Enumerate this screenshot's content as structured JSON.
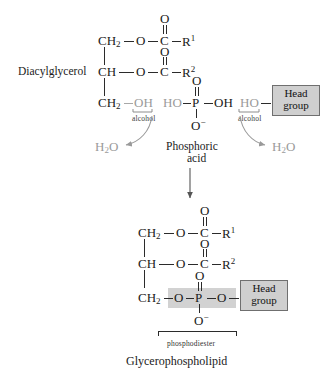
{
  "figure": {
    "background_color": "#ffffff",
    "ink_color": "#1a1a1a",
    "gray_color": "#9a9a9a",
    "highlight_color": "#d2d2d2",
    "headbox_fill": "#cfcfcf",
    "headbox_border": "#6f6f6f"
  },
  "labels": {
    "diacylglycerol": "Diacylglycerol",
    "phosphoric_acid_line1": "Phosphoric",
    "phosphoric_acid_line2": "acid",
    "alcohol_left": "alcohol",
    "alcohol_right": "alcohol",
    "water_left": "H",
    "water_left_sub": "2",
    "water_left_tail": "O",
    "water_right": "H",
    "water_right_sub": "2",
    "water_right_tail": "O",
    "phosphodiester": "phosphodiester",
    "product": "Glycerophospholipid",
    "head_group_line1": "Head",
    "head_group_line2": "group"
  },
  "reactant_top": {
    "name": "Diacylglycerol",
    "rows": [
      {
        "id": "row1",
        "left": "CH",
        "left_sub": "2",
        "linker": "O",
        "carbonyl": "C",
        "carbonyl_o": "O",
        "chain": "R",
        "chain_sup": "1"
      },
      {
        "id": "row2",
        "left": "CH",
        "left_sub": "",
        "linker": "O",
        "carbonyl": "C",
        "carbonyl_o": "O",
        "chain": "R",
        "chain_sup": "2"
      },
      {
        "id": "row3",
        "left": "CH",
        "left_sub": "2",
        "hydroxyl": "OH"
      }
    ]
  },
  "reactant_phosphate": {
    "name": "Phosphoric acid",
    "center": "P",
    "top_oxygen": "O",
    "bottom_oxygen": "O",
    "bottom_oxygen_charge": "−",
    "left_hydroxyl": "HO",
    "right_hydroxyl": "OH"
  },
  "reactant_head": {
    "hydroxyl": "HO",
    "chip_line1": "Head",
    "chip_line2": "group"
  },
  "product": {
    "name": "Glycerophospholipid",
    "bracket_label": "phosphodiester",
    "rows": [
      {
        "id": "prow1",
        "left": "CH",
        "left_sub": "2",
        "linker": "O",
        "carbonyl": "C",
        "carbonyl_o": "O",
        "chain": "R",
        "chain_sup": "1"
      },
      {
        "id": "prow2",
        "left": "CH",
        "left_sub": "",
        "linker": "O",
        "carbonyl": "C",
        "carbonyl_o": "O",
        "chain": "R",
        "chain_sup": "2"
      },
      {
        "id": "prow3",
        "left": "CH",
        "left_sub": "2",
        "linker_left": "O",
        "center": "P",
        "linker_right": "O",
        "top_oxygen": "O",
        "bottom_oxygen": "O",
        "bottom_oxygen_charge": "−"
      }
    ],
    "chip_line1": "Head",
    "chip_line2": "group"
  },
  "byproducts": [
    {
      "id": "water-left",
      "formula": "H2O",
      "arrow": "curved-left"
    },
    {
      "id": "water-right",
      "formula": "H2O",
      "arrow": "curved-right"
    }
  ],
  "reaction_arrow": {
    "direction": "down",
    "style": "straight"
  }
}
